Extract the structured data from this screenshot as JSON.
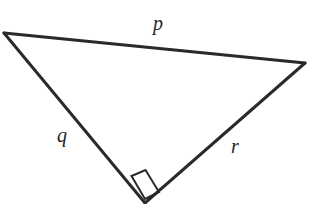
{
  "figure": {
    "kind": "right-triangle-diagram",
    "background_color": "#ffffff",
    "stroke_color": "#2a2a2a",
    "label_color": "#262626",
    "width": 309,
    "height": 204,
    "vertices": {
      "left": {
        "x": 4,
        "y": 33
      },
      "right": {
        "x": 305,
        "y": 63
      },
      "bottom": {
        "x": 145,
        "y": 203
      }
    },
    "sides": [
      {
        "name": "side-p",
        "label": "p",
        "from": "left",
        "to": "right",
        "label_position": {
          "x": 158,
          "y": 25
        }
      },
      {
        "name": "side-q",
        "label": "q",
        "from": "left",
        "to": "bottom",
        "label_position": {
          "x": 62,
          "y": 137
        }
      },
      {
        "name": "side-r",
        "label": "r",
        "from": "bottom",
        "to": "right",
        "label_position": {
          "x": 235,
          "y": 148
        }
      }
    ],
    "right_angle": {
      "at_vertex": "bottom",
      "marker_shape": "square",
      "marker_points": "145,199 131.5,176 145.5,170 159,192"
    }
  }
}
